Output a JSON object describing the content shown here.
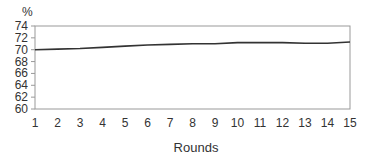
{
  "chart_data": {
    "type": "line",
    "title": "",
    "xlabel": "Rounds",
    "ylabel": "%",
    "x": [
      1,
      2,
      3,
      4,
      5,
      6,
      7,
      8,
      9,
      10,
      11,
      12,
      13,
      14,
      15
    ],
    "series": [
      {
        "name": "",
        "values": [
          70.0,
          70.1,
          70.2,
          70.4,
          70.6,
          70.8,
          70.9,
          71.0,
          71.0,
          71.2,
          71.2,
          71.2,
          71.1,
          71.1,
          71.3
        ],
        "color": "#333333"
      }
    ],
    "ylim": [
      60,
      74
    ],
    "yticks": [
      60,
      62,
      64,
      66,
      68,
      70,
      72,
      74
    ],
    "xticks": [
      "1",
      "2",
      "3",
      "4",
      "5",
      "6",
      "7",
      "8",
      "9",
      "10",
      "11",
      "12",
      "13",
      "14",
      "15"
    ],
    "grid": false,
    "legend": "none",
    "frame": "box"
  }
}
